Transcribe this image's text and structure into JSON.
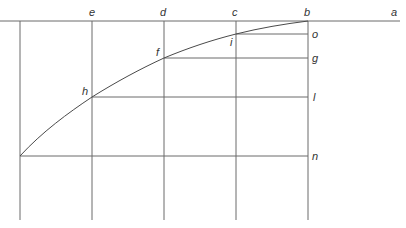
{
  "figure": {
    "type": "geometric-construction"
  },
  "labels": {
    "a": "a",
    "b": "b",
    "c": "c",
    "d": "d",
    "e": "e",
    "f": "f",
    "g": "g",
    "h": "h",
    "i": "i",
    "l": "l",
    "n": "n",
    "o": "o"
  },
  "geometry": {
    "baseline_y": 21,
    "verticals_x": [
      20,
      92,
      164,
      236,
      308
    ],
    "vertical_bottom_y": 220,
    "curve_points": [
      [
        308,
        21
      ],
      [
        236,
        34
      ],
      [
        164,
        58
      ],
      [
        92,
        97
      ],
      [
        20,
        156
      ]
    ],
    "horizontals": [
      {
        "label": "o",
        "y": 34,
        "x_from": 236,
        "x_to": 308
      },
      {
        "label": "g",
        "y": 58,
        "x_from": 164,
        "x_to": 308
      },
      {
        "label": "l",
        "y": 97,
        "x_from": 92,
        "x_to": 308
      },
      {
        "label": "n",
        "y": 156,
        "x_from": 20,
        "x_to": 308
      }
    ]
  },
  "colors": {
    "line": "#6a6a6a",
    "curve": "#4a4a4a",
    "text": "#333333",
    "background": "#ffffff"
  }
}
